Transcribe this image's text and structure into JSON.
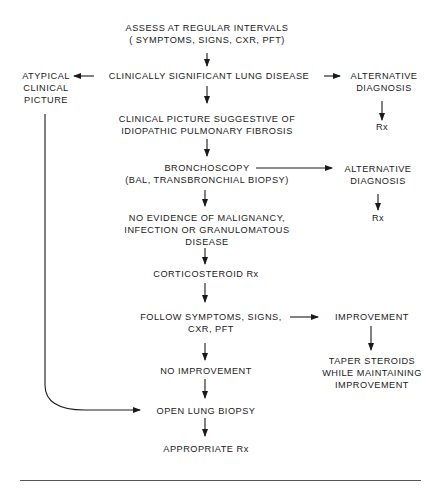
{
  "diagram": {
    "nodes": {
      "assess": {
        "lines": [
          "ASSESS AT REGULAR INTERVALS",
          "( SYMPTOMS, SIGNS, CXR, PFT)"
        ]
      },
      "lung_disease": {
        "lines": [
          "CLINICALLY SIGNIFICANT LUNG DISEASE"
        ]
      },
      "atypical": {
        "lines": [
          "ATYPICAL",
          "CLINICAL",
          "PICTURE"
        ]
      },
      "alt_dx_1": {
        "lines": [
          "ALTERNATIVE",
          "DIAGNOSIS"
        ]
      },
      "rx_1": {
        "lines": [
          "Rx"
        ]
      },
      "ipf": {
        "lines": [
          "CLINICAL PICTURE SUGGESTIVE OF",
          "IDIOPATHIC PULMONARY FIBROSIS"
        ]
      },
      "bronchoscopy": {
        "lines": [
          "BRONCHOSCOPY",
          "(BAL, TRANSBRONCHIAL BIOPSY)"
        ]
      },
      "alt_dx_2": {
        "lines": [
          "ALTERNATIVE",
          "DIAGNOSIS"
        ]
      },
      "rx_2": {
        "lines": [
          "Rx"
        ]
      },
      "no_evidence": {
        "lines": [
          "NO EVIDENCE OF MALIGNANCY,",
          "INFECTION OR GRANULOMATOUS",
          "DISEASE"
        ]
      },
      "corticosteroid": {
        "lines": [
          "CORTICOSTEROID Rx"
        ]
      },
      "follow": {
        "lines": [
          "FOLLOW SYMPTOMS, SIGNS,",
          "CXR, PFT"
        ]
      },
      "improvement": {
        "lines": [
          "IMPROVEMENT"
        ]
      },
      "taper": {
        "lines": [
          "TAPER STEROIDS",
          "WHILE MAINTAINING",
          "IMPROVEMENT"
        ]
      },
      "no_improvement": {
        "lines": [
          "NO IMPROVEMENT"
        ]
      },
      "open_biopsy": {
        "lines": [
          "OPEN LUNG BIOPSY"
        ]
      },
      "appropriate_rx": {
        "lines": [
          "APPROPRIATE Rx"
        ]
      }
    },
    "edges": [
      [
        "assess",
        "lung_disease"
      ],
      [
        "lung_disease",
        "atypical"
      ],
      [
        "lung_disease",
        "alt_dx_1"
      ],
      [
        "alt_dx_1",
        "rx_1"
      ],
      [
        "lung_disease",
        "ipf"
      ],
      [
        "ipf",
        "bronchoscopy"
      ],
      [
        "bronchoscopy",
        "alt_dx_2"
      ],
      [
        "alt_dx_2",
        "rx_2"
      ],
      [
        "bronchoscopy",
        "no_evidence"
      ],
      [
        "no_evidence",
        "corticosteroid"
      ],
      [
        "corticosteroid",
        "follow"
      ],
      [
        "follow",
        "improvement"
      ],
      [
        "improvement",
        "taper"
      ],
      [
        "follow",
        "no_improvement"
      ],
      [
        "no_improvement",
        "open_biopsy"
      ],
      [
        "atypical",
        "open_biopsy"
      ],
      [
        "open_biopsy",
        "appropriate_rx"
      ]
    ],
    "colors": {
      "ink": "#1a1a1a",
      "background": "#ffffff"
    }
  }
}
